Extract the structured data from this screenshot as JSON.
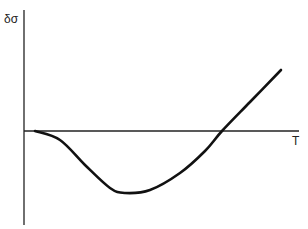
{
  "chart_data": {
    "type": "line",
    "title": "",
    "xlabel": "T",
    "ylabel": "δσ",
    "grid": false,
    "legend": null,
    "series": [
      {
        "name": "δσ(T)",
        "description": "Starts at zero, dips to a negative minimum, then rises through zero and increases roughly linearly",
        "points_px": [
          [
            35,
            131
          ],
          [
            60,
            140
          ],
          [
            85,
            165
          ],
          [
            110,
            188
          ],
          [
            125,
            193
          ],
          [
            150,
            190
          ],
          [
            180,
            173
          ],
          [
            205,
            151
          ],
          [
            222,
            131
          ],
          [
            250,
            102
          ],
          [
            281,
            70
          ]
        ],
        "x": [
          0.04,
          0.13,
          0.22,
          0.31,
          0.37,
          0.46,
          0.57,
          0.66,
          0.72,
          0.82,
          0.93
        ],
        "y": [
          0.0,
          -0.08,
          -0.31,
          -0.52,
          -0.57,
          -0.54,
          -0.39,
          -0.19,
          0.0,
          0.26,
          0.55
        ]
      }
    ],
    "axes": {
      "origin_px": [
        24,
        131
      ],
      "y_axis_px": {
        "x": 24,
        "top": 10,
        "bottom": 225
      },
      "x_axis_px": {
        "y": 131,
        "left": 24,
        "right": 299
      }
    },
    "ticks": false
  },
  "labels": {
    "y_axis": "δσ",
    "x_axis": "T"
  }
}
